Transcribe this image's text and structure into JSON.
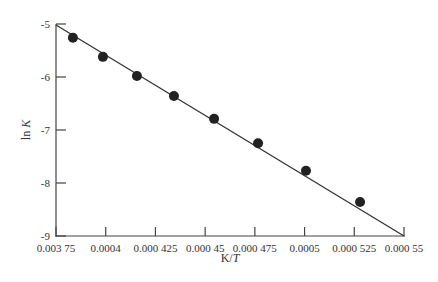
{
  "chart_data": {
    "type": "scatter",
    "title": "",
    "xlabel": "K/T",
    "ylabel": "ln K",
    "xlim": [
      0.000375,
      0.00055
    ],
    "ylim": [
      -9,
      -5
    ],
    "grid": false,
    "legend": null,
    "x_ticks": [
      0.000375,
      0.0004,
      0.000425,
      0.00045,
      0.000475,
      0.0005,
      0.000525,
      0.00055
    ],
    "x_tick_labels": [
      "0.003 75",
      "0.0004",
      "0.000 425",
      "0.000 45",
      "0.000 475",
      "0.0005",
      "0.000 525",
      "0.000 55"
    ],
    "y_ticks": [
      -5,
      -6,
      -7,
      -8,
      -9
    ],
    "y_tick_labels": [
      "-5",
      "-6",
      "-7",
      "-8",
      "-9"
    ],
    "series": [
      {
        "name": "data points",
        "marker": "filled-circle",
        "color": "#222222",
        "x": [
          0.0003835,
          0.0003986,
          0.0004157,
          0.0004343,
          0.0004545,
          0.0004766,
          0.0005007,
          0.0005279
        ],
        "y": [
          -5.26,
          -5.62,
          -5.98,
          -6.36,
          -6.79,
          -7.25,
          -7.77,
          -8.36
        ]
      },
      {
        "name": "fit line",
        "type": "line",
        "color": "#333333",
        "x": [
          0.000375,
          0.00055
        ],
        "y": [
          -5.02,
          -9.0
        ]
      }
    ]
  },
  "labels": {
    "xlabel_prefix": "K/",
    "xlabel_var": "T",
    "ylabel_prefix": "ln ",
    "ylabel_var": "K"
  }
}
